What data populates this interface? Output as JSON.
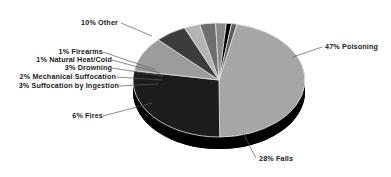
{
  "chart_data": {
    "type": "pie",
    "title": "",
    "subtitle": "",
    "xlabel": "",
    "ylabel": "",
    "grid": false,
    "legend_position": "none",
    "style": "3d-pie-exploded-labels",
    "total_percent": 101,
    "categories": [
      "Poisoning",
      "Falls",
      "Other",
      "Fires",
      "Suffocation by Ingestion",
      "Drowning",
      "Mechanical Suffocation",
      "Natural Heat/Cold",
      "Firearms"
    ],
    "values": [
      47,
      28,
      10,
      6,
      3,
      3,
      2,
      1,
      1
    ],
    "slices": [
      {
        "label": "47% Poisoning",
        "name": "Poisoning",
        "percent": 47,
        "color": "#a6a6a6",
        "side_color": "#000000"
      },
      {
        "label": "28% Falls",
        "name": "Falls",
        "percent": 28,
        "color": "#1c1c1c",
        "side_color": "#000000"
      },
      {
        "label": "10% Other",
        "name": "Other",
        "percent": 10,
        "color": "#9c9c9c",
        "side_color": "#000000"
      },
      {
        "label": "6% Fires",
        "name": "Fires",
        "percent": 6,
        "color": "#3c3c3c",
        "side_color": "#000000"
      },
      {
        "label": "3% Suffocation by Ingestion",
        "name": "Suffocation by Ingestion",
        "percent": 3,
        "color": "#b4b4b4",
        "side_color": "#000000"
      },
      {
        "label": "3% Drowning",
        "name": "Drowning",
        "percent": 3,
        "color": "#6e6e6e",
        "side_color": "#000000"
      },
      {
        "label": "2% Mechanical Suffocation",
        "name": "Mechanical Suffocation",
        "percent": 2,
        "color": "#8a8a8a",
        "side_color": "#000000"
      },
      {
        "label": "1% Natural Heat/Cold",
        "name": "Natural Heat/Cold",
        "percent": 1,
        "color": "#000000",
        "side_color": "#000000"
      },
      {
        "label": "1% Firearms",
        "name": "Firearms",
        "percent": 1,
        "color": "#5a5a5a",
        "side_color": "#000000"
      }
    ]
  },
  "labels": {
    "other": "10% Other",
    "firearms": "1% Firearms",
    "natural_heat_cold": "1% Natural Heat/Cold",
    "drowning": "3% Drowning",
    "mechanical_suffocation": "2% Mechanical Suffocation",
    "suffocation_by_ingestion": "3% Suffocation by Ingestion",
    "fires": "6% Fires",
    "falls": "28% Falls",
    "poisoning": "47% Poisoning"
  },
  "colors": {
    "background": "#ffffff",
    "text": "#1a1a1a",
    "leader_line": "#4a4a4a",
    "pie_edge": "#e8e8e8"
  }
}
